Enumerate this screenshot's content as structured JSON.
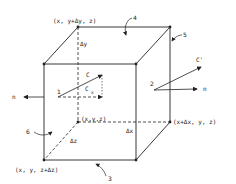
{
  "diagram": {
    "type": "control-volume-cube",
    "corner_labels": {
      "top_back_left": "(x, y+Δy, z)",
      "origin": "(x,y,z)",
      "right_back_bottom": "(x+Δx, y, z)",
      "front_bottom_left": "(x, y, z+Δz)"
    },
    "dimension_labels": {
      "dy": "Δy",
      "dx": "Δx",
      "dz": "Δz"
    },
    "face_numbers": [
      "1",
      "2",
      "3",
      "4",
      "5",
      "6"
    ],
    "vectors": {
      "c": "C",
      "cx": "C",
      "cx_sub": "x",
      "c_prime": "C'",
      "n_left": "n",
      "n_right": "n"
    },
    "colors": {
      "line": "#222222",
      "background": "#ffffff"
    }
  }
}
